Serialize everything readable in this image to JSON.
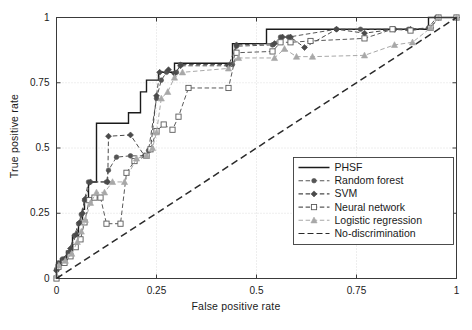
{
  "figure": {
    "width": 472,
    "height": 330,
    "background": "#ffffff"
  },
  "axes": {
    "xlabel": "False positive rate",
    "ylabel": "True positive rate",
    "xticks": [
      "0",
      "0.25",
      "0.5",
      "0.75",
      "1"
    ],
    "yticks": [
      "0",
      "0.25",
      "0.5",
      "0.75",
      "1"
    ],
    "xlim": [
      0,
      1
    ],
    "ylim": [
      0,
      1
    ],
    "grid": true,
    "grid_color": "#cfcfcf",
    "frame_color": "#3a3a3a"
  },
  "legend": {
    "position": "lower-right",
    "entries": [
      {
        "label": "PHSF",
        "color": "#1a1a1a",
        "style": "solid",
        "marker": "none"
      },
      {
        "label": "Random forest",
        "color": "#555555",
        "style": "dashed",
        "marker": "circle-filled"
      },
      {
        "label": "SVM",
        "color": "#4a4a4a",
        "style": "dashed",
        "marker": "diamond-filled"
      },
      {
        "label": "Neural network",
        "color": "#5a5a5a",
        "style": "dashed",
        "marker": "square-open"
      },
      {
        "label": "Logistic regression",
        "color": "#a8a8a8",
        "style": "dashed",
        "marker": "triangle-filled"
      },
      {
        "label": "No-discrimination",
        "color": "#2a2a2a",
        "style": "dashed",
        "marker": "none"
      }
    ]
  },
  "chart_data": {
    "type": "line",
    "title": "",
    "xlabel": "False positive rate",
    "ylabel": "True positive rate",
    "xlim": [
      0,
      1
    ],
    "ylim": [
      0,
      1
    ],
    "grid": true,
    "legend_position": "lower-right",
    "series": [
      {
        "name": "PHSF",
        "color": "#1a1a1a",
        "style": "solid",
        "marker": "none",
        "drawstyle": "steps-post",
        "points": [
          [
            0.0,
            0.0
          ],
          [
            0.0,
            0.05
          ],
          [
            0.01,
            0.05
          ],
          [
            0.01,
            0.075
          ],
          [
            0.025,
            0.075
          ],
          [
            0.025,
            0.105
          ],
          [
            0.04,
            0.105
          ],
          [
            0.04,
            0.165
          ],
          [
            0.055,
            0.165
          ],
          [
            0.055,
            0.215
          ],
          [
            0.065,
            0.215
          ],
          [
            0.065,
            0.265
          ],
          [
            0.07,
            0.265
          ],
          [
            0.07,
            0.31
          ],
          [
            0.08,
            0.31
          ],
          [
            0.08,
            0.37
          ],
          [
            0.1,
            0.37
          ],
          [
            0.1,
            0.595
          ],
          [
            0.18,
            0.595
          ],
          [
            0.18,
            0.635
          ],
          [
            0.21,
            0.635
          ],
          [
            0.21,
            0.715
          ],
          [
            0.225,
            0.715
          ],
          [
            0.225,
            0.76
          ],
          [
            0.255,
            0.76
          ],
          [
            0.255,
            0.79
          ],
          [
            0.295,
            0.79
          ],
          [
            0.295,
            0.825
          ],
          [
            0.44,
            0.825
          ],
          [
            0.44,
            0.9
          ],
          [
            0.525,
            0.9
          ],
          [
            0.525,
            0.955
          ],
          [
            0.93,
            0.955
          ],
          [
            0.93,
            1.0
          ],
          [
            1.0,
            1.0
          ]
        ]
      },
      {
        "name": "Random forest",
        "color": "#555555",
        "style": "dashed",
        "marker": "circle-filled",
        "drawstyle": "linear",
        "points": [
          [
            0.0,
            0.035
          ],
          [
            0.005,
            0.06
          ],
          [
            0.015,
            0.075
          ],
          [
            0.03,
            0.1
          ],
          [
            0.045,
            0.165
          ],
          [
            0.055,
            0.21
          ],
          [
            0.062,
            0.245
          ],
          [
            0.07,
            0.3
          ],
          [
            0.08,
            0.37
          ],
          [
            0.125,
            0.37
          ],
          [
            0.13,
            0.415
          ],
          [
            0.15,
            0.465
          ],
          [
            0.185,
            0.47
          ],
          [
            0.225,
            0.47
          ],
          [
            0.23,
            0.49
          ],
          [
            0.25,
            0.69
          ],
          [
            0.262,
            0.76
          ],
          [
            0.275,
            0.79
          ],
          [
            0.3,
            0.79
          ],
          [
            0.31,
            0.82
          ],
          [
            0.44,
            0.82
          ],
          [
            0.45,
            0.89
          ],
          [
            0.54,
            0.895
          ],
          [
            0.56,
            0.925
          ],
          [
            0.58,
            0.925
          ],
          [
            0.7,
            0.955
          ],
          [
            0.76,
            0.955
          ],
          [
            0.84,
            0.955
          ],
          [
            0.88,
            0.955
          ],
          [
            0.93,
            0.96
          ],
          [
            0.95,
            1.0
          ],
          [
            1.0,
            1.0
          ]
        ]
      },
      {
        "name": "SVM",
        "color": "#4a4a4a",
        "style": "dashed",
        "marker": "diamond-filled",
        "drawstyle": "linear",
        "points": [
          [
            0.0,
            0.03
          ],
          [
            0.008,
            0.055
          ],
          [
            0.02,
            0.075
          ],
          [
            0.035,
            0.115
          ],
          [
            0.05,
            0.17
          ],
          [
            0.058,
            0.215
          ],
          [
            0.065,
            0.25
          ],
          [
            0.072,
            0.305
          ],
          [
            0.085,
            0.37
          ],
          [
            0.128,
            0.37
          ],
          [
            0.13,
            0.545
          ],
          [
            0.185,
            0.55
          ],
          [
            0.22,
            0.47
          ],
          [
            0.235,
            0.495
          ],
          [
            0.25,
            0.7
          ],
          [
            0.258,
            0.79
          ],
          [
            0.28,
            0.8
          ],
          [
            0.295,
            0.785
          ],
          [
            0.31,
            0.815
          ],
          [
            0.43,
            0.815
          ],
          [
            0.45,
            0.895
          ],
          [
            0.545,
            0.9
          ],
          [
            0.565,
            0.925
          ],
          [
            0.585,
            0.925
          ],
          [
            0.62,
            0.885
          ],
          [
            0.7,
            0.955
          ],
          [
            0.77,
            0.94
          ],
          [
            0.845,
            0.955
          ],
          [
            0.885,
            0.955
          ],
          [
            0.935,
            0.96
          ],
          [
            0.955,
            1.0
          ],
          [
            1.0,
            1.0
          ]
        ]
      },
      {
        "name": "Neural network",
        "color": "#5a5a5a",
        "style": "dashed",
        "marker": "square-open",
        "drawstyle": "linear",
        "points": [
          [
            0.0,
            0.0
          ],
          [
            0.005,
            0.045
          ],
          [
            0.02,
            0.06
          ],
          [
            0.035,
            0.085
          ],
          [
            0.048,
            0.12
          ],
          [
            0.06,
            0.15
          ],
          [
            0.07,
            0.215
          ],
          [
            0.082,
            0.3
          ],
          [
            0.095,
            0.31
          ],
          [
            0.11,
            0.31
          ],
          [
            0.125,
            0.21
          ],
          [
            0.16,
            0.21
          ],
          [
            0.175,
            0.405
          ],
          [
            0.195,
            0.45
          ],
          [
            0.225,
            0.47
          ],
          [
            0.235,
            0.495
          ],
          [
            0.25,
            0.565
          ],
          [
            0.268,
            0.59
          ],
          [
            0.29,
            0.57
          ],
          [
            0.305,
            0.62
          ],
          [
            0.33,
            0.73
          ],
          [
            0.43,
            0.73
          ],
          [
            0.45,
            0.865
          ],
          [
            0.54,
            0.87
          ],
          [
            0.56,
            0.905
          ],
          [
            0.585,
            0.905
          ],
          [
            0.635,
            0.91
          ],
          [
            0.77,
            0.92
          ],
          [
            0.84,
            0.955
          ],
          [
            0.885,
            0.95
          ],
          [
            0.935,
            0.96
          ],
          [
            0.955,
            1.0
          ],
          [
            1.0,
            1.0
          ]
        ]
      },
      {
        "name": "Logistic regression",
        "color": "#a8a8a8",
        "style": "dashed",
        "marker": "triangle-filled",
        "drawstyle": "linear",
        "points": [
          [
            0.0,
            0.01
          ],
          [
            0.006,
            0.05
          ],
          [
            0.022,
            0.068
          ],
          [
            0.038,
            0.095
          ],
          [
            0.052,
            0.14
          ],
          [
            0.062,
            0.18
          ],
          [
            0.072,
            0.225
          ],
          [
            0.085,
            0.29
          ],
          [
            0.1,
            0.33
          ],
          [
            0.12,
            0.33
          ],
          [
            0.14,
            0.37
          ],
          [
            0.17,
            0.37
          ],
          [
            0.2,
            0.46
          ],
          [
            0.225,
            0.47
          ],
          [
            0.24,
            0.5
          ],
          [
            0.25,
            0.56
          ],
          [
            0.262,
            0.69
          ],
          [
            0.278,
            0.715
          ],
          [
            0.295,
            0.77
          ],
          [
            0.315,
            0.79
          ],
          [
            0.43,
            0.805
          ],
          [
            0.455,
            0.845
          ],
          [
            0.545,
            0.845
          ],
          [
            0.57,
            0.88
          ],
          [
            0.6,
            0.85
          ],
          [
            0.64,
            0.85
          ],
          [
            0.77,
            0.855
          ],
          [
            0.845,
            0.895
          ],
          [
            0.89,
            0.905
          ],
          [
            0.935,
            0.96
          ],
          [
            0.955,
            1.0
          ],
          [
            1.0,
            1.0
          ]
        ]
      },
      {
        "name": "No-discrimination",
        "color": "#2a2a2a",
        "style": "dashed",
        "marker": "none",
        "drawstyle": "linear",
        "points": [
          [
            0.0,
            0.0
          ],
          [
            1.0,
            1.0
          ]
        ]
      }
    ]
  }
}
